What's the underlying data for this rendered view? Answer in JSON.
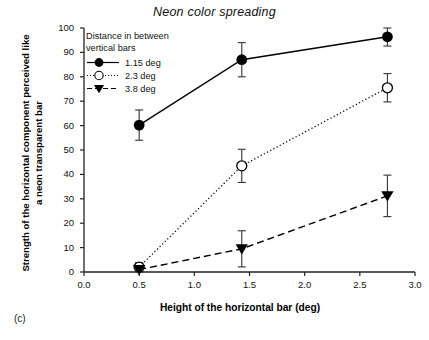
{
  "figure": {
    "panel_label": "(c)",
    "title": "Neon color spreading"
  },
  "chart_data": {
    "type": "line",
    "title": "Neon color spreading",
    "xlabel": "Height of the horizontal bar (deg)",
    "ylabel": "Strength of the horizontal component perceived like a neon transparent bar",
    "xlim": [
      0.0,
      3.0
    ],
    "ylim": [
      0,
      100
    ],
    "xticks": [
      "0.0",
      "0.5",
      "1.0",
      "1.5",
      "2.0",
      "2.5",
      "3.0"
    ],
    "yticks": [
      "0",
      "10",
      "20",
      "30",
      "40",
      "50",
      "60",
      "70",
      "80",
      "90",
      "100"
    ],
    "grid": false,
    "legend_position": "upper-left-inside",
    "legend_title": "Distance in between\nvertical bars",
    "x": [
      0.5,
      1.43,
      2.75
    ],
    "series": [
      {
        "name": "1.15 deg",
        "marker": "filled-circle",
        "line": "solid",
        "values": [
          60.2,
          87.0,
          96.4
        ],
        "errors": [
          6.2,
          7.0,
          3.8
        ]
      },
      {
        "name": "2.3 deg",
        "marker": "open-circle",
        "line": "dotted",
        "values": [
          2.0,
          43.5,
          75.5
        ],
        "errors": [
          1.8,
          6.8,
          5.8
        ]
      },
      {
        "name": "3.8 deg",
        "marker": "filled-triangle-down",
        "line": "dashed",
        "values": [
          1.0,
          9.5,
          31.2
        ],
        "errors": [
          1.0,
          7.4,
          8.5
        ]
      }
    ],
    "colors": {
      "axis": "#222222",
      "series": "#000000",
      "background": "#ffffff"
    }
  },
  "axis_labels": {
    "y": "Strength of the horizontal component perceived like a neon transparent bar",
    "x": "Height of the horizontal bar (deg)"
  }
}
